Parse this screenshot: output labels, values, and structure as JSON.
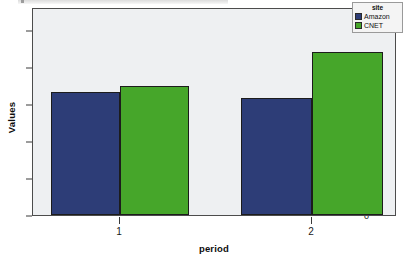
{
  "chart_data": {
    "type": "bar",
    "title": "",
    "subtitle": "",
    "xlabel": "period",
    "ylabel": "Values",
    "categories": [
      "1",
      "2"
    ],
    "ylim": [
      0,
      11.2
    ],
    "yticks": [
      0,
      2,
      4,
      6,
      8,
      10
    ],
    "ytick_labels": [
      "0",
      "2",
      "4",
      "6",
      "8",
      "10"
    ],
    "grid": false,
    "legend_position": "top-right",
    "legend_title": "site",
    "series": [
      {
        "name": "Amazon",
        "color": "#2d3d77",
        "values": [
          6.65,
          6.35
        ]
      },
      {
        "name": "CNET",
        "color": "#46a62a",
        "values": [
          7.0,
          8.8
        ]
      }
    ],
    "plot_background": "#eef0f2",
    "frame_color": "#4c4c4c"
  },
  "legend": {
    "title": "site",
    "entries": [
      {
        "label": "Amazon",
        "color": "#2d3d77"
      },
      {
        "label": "CNET",
        "color": "#46a62a"
      }
    ]
  },
  "axes": {
    "y": {
      "label": "Values",
      "tick_labels": [
        "10",
        "8",
        "6",
        "4",
        "2",
        "0"
      ]
    },
    "x": {
      "label": "period",
      "tick_labels": [
        "1",
        "2"
      ]
    }
  }
}
